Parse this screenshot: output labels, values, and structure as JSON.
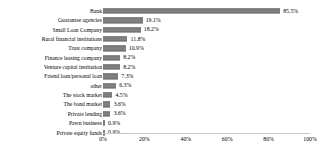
{
  "chart_data": {
    "type": "bar",
    "orientation": "horizontal",
    "title": "",
    "xlabel": "",
    "ylabel": "",
    "xlim": [
      0,
      100
    ],
    "xunit": "%",
    "grid": false,
    "legend": null,
    "bar_color": "#808080",
    "axis_color": "#c8c8c8",
    "xticks": [
      {
        "value": 0,
        "label": "0%"
      },
      {
        "value": 20,
        "label": "20%"
      },
      {
        "value": 40,
        "label": "40%"
      },
      {
        "value": 60,
        "label": "60%"
      },
      {
        "value": 80,
        "label": "80%"
      },
      {
        "value": 100,
        "label": "100%"
      }
    ],
    "categories": [
      "Bank",
      "Guarantee agencies",
      "Small Loan Company",
      "Rural financial institutions",
      "Trust company",
      "Finance leasing company",
      "Venture capital institution",
      "Friend loan/personal loan",
      "other",
      "The stock market",
      "The bond market",
      "Private lending",
      "Pawn business",
      "Private equity funds"
    ],
    "values": [
      85.5,
      19.1,
      18.2,
      11.8,
      10.9,
      8.2,
      8.2,
      7.3,
      6.3,
      4.5,
      3.6,
      3.6,
      0.9,
      0.9
    ],
    "data_labels": [
      "85.5%",
      "19.1%",
      "18.2%",
      "11.8%",
      "10.9%",
      "8.2%",
      "8.2%",
      "7.3%",
      "6.3%",
      "4.5%",
      "3.6%",
      "3.6%",
      "0.9%",
      "0.9%"
    ]
  }
}
